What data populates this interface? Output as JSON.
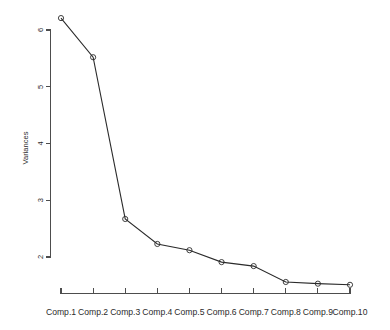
{
  "chart_data": {
    "type": "line",
    "title": "",
    "xlabel": "",
    "ylabel": "Variances",
    "categories": [
      "Comp.1",
      "Comp.2",
      "Comp.3",
      "Comp.4",
      "Comp.5",
      "Comp.6",
      "Comp.7",
      "Comp.8",
      "Comp.9",
      "Comp.10"
    ],
    "values": [
      6.21,
      5.52,
      2.67,
      2.23,
      2.12,
      1.91,
      1.84,
      1.56,
      1.53,
      1.51
    ],
    "series": [
      {
        "name": "Variances",
        "values": [
          6.21,
          5.52,
          2.67,
          2.23,
          2.12,
          1.91,
          1.84,
          1.56,
          1.53,
          1.51
        ]
      }
    ],
    "ylim": [
      1.38,
      6.35
    ],
    "yticks": [
      2,
      3,
      4,
      5,
      6
    ],
    "ytick_labels": [
      "2",
      "3",
      "4",
      "5",
      "6"
    ],
    "grid": false,
    "legend": false,
    "marker": "open-circle",
    "line_color": "#2b2b2b",
    "axis_color": "#4d4d4d",
    "background": "#ffffff"
  },
  "axes": {
    "y_title": "Variances",
    "y_tick_labels": [
      "6",
      "5",
      "4",
      "3",
      "2"
    ],
    "x_tick_labels": [
      "Comp.1",
      "Comp.2",
      "Comp.3",
      "Comp.4",
      "Comp.5",
      "Comp.6",
      "Comp.7",
      "Comp.8",
      "Comp.9",
      "Comp.10"
    ]
  }
}
